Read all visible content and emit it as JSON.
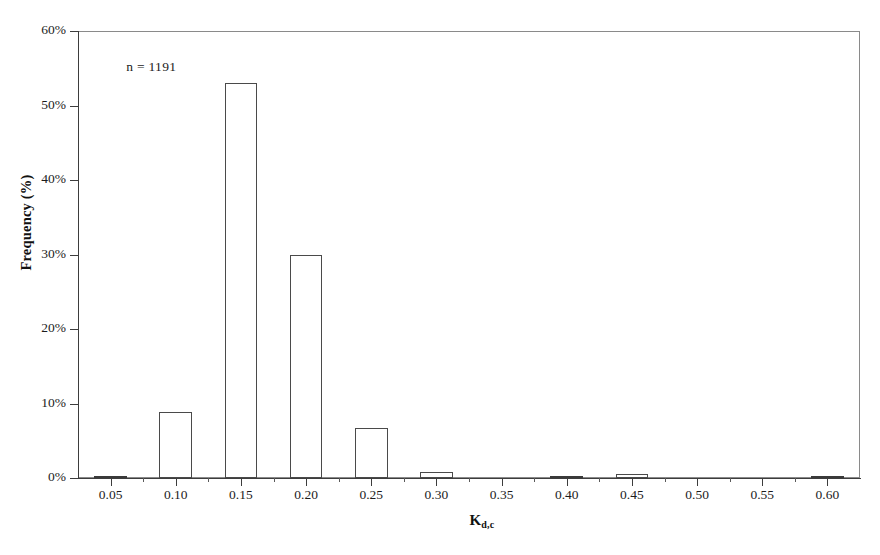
{
  "chart_data": {
    "type": "bar",
    "title": "",
    "subtitle": "",
    "xlabel_main": "K",
    "xlabel_sub": "d,c",
    "ylabel": "Frequency (%)",
    "annotation": "n = 1191",
    "grid": false,
    "legend": null,
    "xlim": [
      0.025,
      0.625
    ],
    "ylim": [
      0,
      60
    ],
    "ytick_values": [
      0,
      10,
      20,
      30,
      40,
      50,
      60
    ],
    "ytick_labels": [
      "0%",
      "10%",
      "20%",
      "30%",
      "40%",
      "50%",
      "60%"
    ],
    "xtick_values": [
      0.05,
      0.1,
      0.15,
      0.2,
      0.25,
      0.3,
      0.35,
      0.4,
      0.45,
      0.5,
      0.55,
      0.6
    ],
    "xtick_labels": [
      "0.05",
      "0.10",
      "0.15",
      "0.20",
      "0.25",
      "0.30",
      "0.35",
      "0.40",
      "0.45",
      "0.50",
      "0.55",
      "0.60"
    ],
    "xtick_minor_values": [
      0.075,
      0.125,
      0.175,
      0.225,
      0.275,
      0.325,
      0.375,
      0.425,
      0.475,
      0.525,
      0.575
    ],
    "bar_width": 0.025,
    "categories": [
      "0.05",
      "0.10",
      "0.15",
      "0.20",
      "0.25",
      "0.30",
      "0.35",
      "0.40",
      "0.45",
      "0.50",
      "0.55",
      "0.60"
    ],
    "values": [
      0.2,
      8.9,
      53.0,
      30.0,
      6.7,
      0.8,
      0.0,
      0.2,
      0.6,
      0.0,
      0.0,
      0.2
    ],
    "bar_fill_color": "#ffffff",
    "bar_edge_color": "#4a4a4a",
    "frame_color": "#8a8a8a",
    "axis_color": "#3d3d3d",
    "background_color": "#ffffff"
  }
}
